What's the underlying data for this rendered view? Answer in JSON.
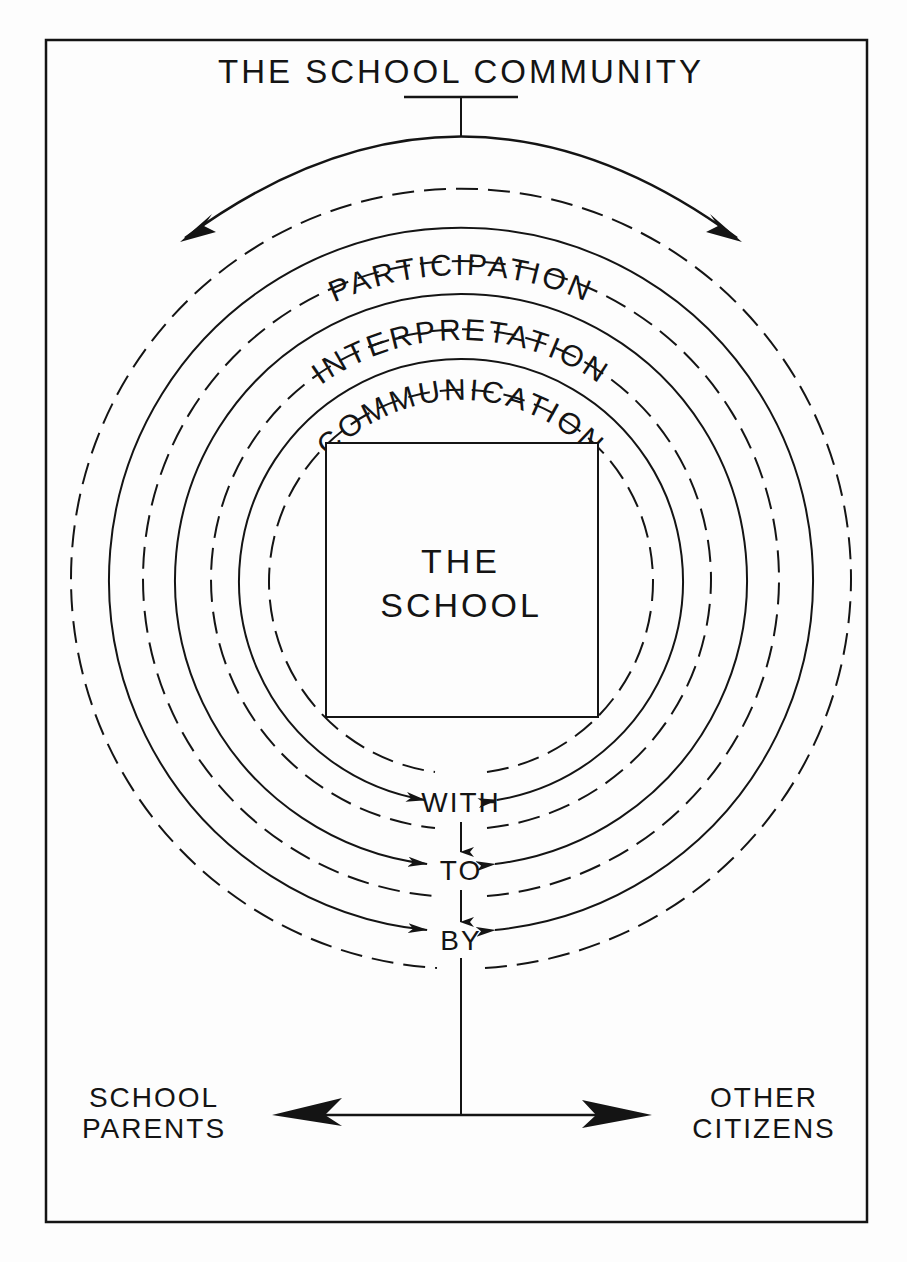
{
  "diagram": {
    "title": "THE SCHOOL COMMUNITY",
    "center": {
      "line1": "THE",
      "line2": "SCHOOL"
    },
    "rings": [
      {
        "label": "PARTICIPATION",
        "connector": "BY"
      },
      {
        "label": "INTERPRETATION",
        "connector": "TO"
      },
      {
        "label": "COMMUNICATION",
        "connector": "WITH"
      }
    ],
    "flow_words": [
      "WITH",
      "TO",
      "BY"
    ],
    "outputs": {
      "left": {
        "line1": "SCHOOL",
        "line2": "PARENTS"
      },
      "right": {
        "line1": "OTHER",
        "line2": "CITIZENS"
      }
    },
    "colors": {
      "ink": "#141414",
      "paper": "#fdfdfd"
    }
  }
}
